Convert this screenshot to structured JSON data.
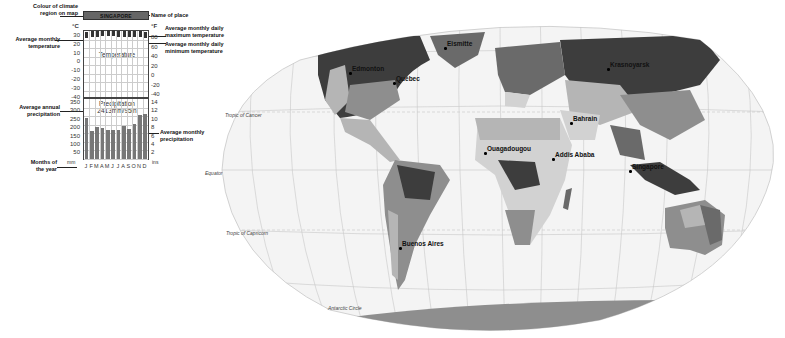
{
  "legend": {
    "colour_label": "Colour of climate region on map",
    "name_label": "Name of place",
    "avg_temp_label": "Average monthly temperature",
    "avg_max_label": "Average monthly daily maximum temperature",
    "avg_min_label": "Average monthly daily minimum temperature",
    "avg_annual_precip_label": "Average annual precipitation",
    "avg_monthly_precip_label": "Average monthly precipitation",
    "months_label": "Months of the year"
  },
  "climate_chart": {
    "place": "SINGAPORE",
    "temp_box_label": "Temperature",
    "precip_box_label": "Precipitation",
    "annual_precip": "2413mm/95in",
    "unit_c": "°C",
    "unit_f": "°F",
    "unit_mm": "mm",
    "unit_ins": "ins",
    "celsius_ticks": [
      "30",
      "20",
      "10",
      "0",
      "-10",
      "-20",
      "-30",
      "-40"
    ],
    "fahrenheit_ticks": [
      "80",
      "60",
      "40",
      "20",
      "0",
      "-20",
      "-40"
    ],
    "mm_ticks": [
      "350",
      "300",
      "250",
      "200",
      "150",
      "100",
      "50"
    ],
    "ins_ticks": [
      "14",
      "12",
      "10",
      "8",
      "6",
      "4",
      "2"
    ],
    "months": [
      "J",
      "F",
      "M",
      "A",
      "M",
      "J",
      "J",
      "A",
      "S",
      "O",
      "N",
      "D"
    ]
  },
  "chart_data": {
    "type": "bar",
    "title": "SINGAPORE",
    "categories": [
      "J",
      "F",
      "M",
      "A",
      "M",
      "J",
      "J",
      "A",
      "S",
      "O",
      "N",
      "D"
    ],
    "series": [
      {
        "name": "Average monthly precipitation (mm)",
        "values": [
          240,
          165,
          185,
          180,
          170,
          170,
          170,
          195,
          175,
          205,
          255,
          260
        ]
      },
      {
        "name": "Average monthly temperature (°C)",
        "values": [
          26,
          27,
          27,
          28,
          28,
          28,
          27,
          27,
          27,
          27,
          27,
          26
        ]
      }
    ],
    "annual_precipitation": "2413mm/95in",
    "xlabel": "Months of the year",
    "ylabel": "mm",
    "ylim": [
      0,
      350
    ],
    "temp_ylim": [
      -40,
      30
    ]
  },
  "map": {
    "places": [
      {
        "name": "Eismitte",
        "x": 447,
        "y": 44
      },
      {
        "name": "Edmonton",
        "x": 352,
        "y": 69
      },
      {
        "name": "Québec",
        "x": 396,
        "y": 79
      },
      {
        "name": "Krasnoyarsk",
        "x": 610,
        "y": 65
      },
      {
        "name": "Bahrain",
        "x": 573,
        "y": 119
      },
      {
        "name": "Ouagadougou",
        "x": 487,
        "y": 149
      },
      {
        "name": "Addis Ababa",
        "x": 555,
        "y": 155
      },
      {
        "name": "Singapore",
        "x": 632,
        "y": 167
      },
      {
        "name": "Buenos Aires",
        "x": 402,
        "y": 244
      }
    ],
    "lines": [
      {
        "name": "Tropic of Cancer",
        "x": 225,
        "y": 112
      },
      {
        "name": "Equator",
        "x": 205,
        "y": 170
      },
      {
        "name": "Tropic of Capricorn",
        "x": 226,
        "y": 230
      },
      {
        "name": "Antarctic Circle",
        "x": 328,
        "y": 305
      }
    ],
    "colors": {
      "darkest": "#3d3d3d",
      "dark": "#6a6a6a",
      "mid": "#8e8e8e",
      "light": "#b5b5b5",
      "lighter": "#d2d2d2",
      "ocean": "#f4f4f4",
      "grid": "#c8c8c8"
    }
  }
}
